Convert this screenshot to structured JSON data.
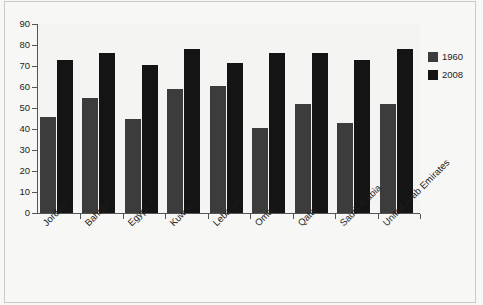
{
  "chart_data": {
    "type": "bar",
    "title": "",
    "xlabel": "",
    "ylabel": "",
    "ylim": [
      0,
      90
    ],
    "ytick_step": 10,
    "grid": false,
    "legend_position": "right",
    "categories": [
      "Jordan",
      "Bahrain",
      "Egypt",
      "Kuwait",
      "Lebanon",
      "Oman",
      "Qatar",
      "Saudi Arabia",
      "United Arab Emirates"
    ],
    "ytick_labels": [
      "0",
      "10",
      "20",
      "30",
      "40",
      "50",
      "60",
      "70",
      "80",
      "90"
    ],
    "series": [
      {
        "name": "1960",
        "color": "#3c3c3c",
        "values": [
          45.5,
          55,
          45,
          59,
          60.5,
          40.5,
          52,
          43,
          52
        ]
      },
      {
        "name": "2008",
        "color": "#141414",
        "values": [
          73,
          76,
          70.5,
          78,
          71.5,
          76,
          76,
          73,
          78
        ]
      }
    ]
  },
  "legend": {
    "entries": [
      {
        "label": "1960",
        "color": "#3c3c3c"
      },
      {
        "label": "2008",
        "color": "#141414"
      }
    ]
  },
  "colors": {
    "background": "#f7f7f5",
    "plot_background": "#f4f4f2",
    "axis": "#555555",
    "text": "#1d1d1d",
    "series_1960": "#3c3c3c",
    "series_2008": "#141414"
  }
}
